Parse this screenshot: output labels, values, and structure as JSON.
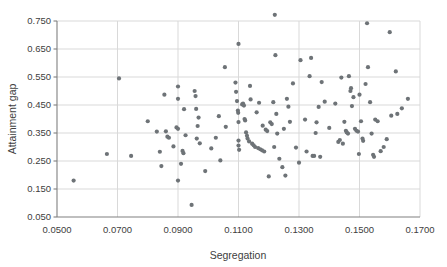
{
  "chart_data": {
    "type": "scatter",
    "title": "",
    "xlabel": "Segregation",
    "ylabel": "Attainment gap",
    "xlim": [
      0.05,
      0.17
    ],
    "ylim": [
      0.05,
      0.75
    ],
    "xticks": [
      0.05,
      0.07,
      0.09,
      0.11,
      0.13,
      0.15,
      0.17
    ],
    "yticks": [
      0.05,
      0.15,
      0.25,
      0.35,
      0.45,
      0.55,
      0.65,
      0.75
    ],
    "xtick_labels": [
      "0.0500",
      "0.0700",
      "0.0900",
      "0.1100",
      "0.1300",
      "0.1500",
      "0.1700"
    ],
    "ytick_labels": [
      "0.050",
      "0.150",
      "0.250",
      "0.350",
      "0.450",
      "0.550",
      "0.650",
      "0.750"
    ],
    "grid": "both",
    "grid_color": "#d9d9d9",
    "axis_color": "#808080",
    "marker_color": "#6e7377",
    "marker_size": 4.2,
    "legend": "none",
    "series": [
      {
        "name": "districts",
        "points": [
          [
            0.0555,
            0.18
          ],
          [
            0.0665,
            0.275
          ],
          [
            0.0705,
            0.545
          ],
          [
            0.0745,
            0.268
          ],
          [
            0.08,
            0.392
          ],
          [
            0.083,
            0.355
          ],
          [
            0.084,
            0.283
          ],
          [
            0.0845,
            0.232
          ],
          [
            0.0855,
            0.487
          ],
          [
            0.086,
            0.356
          ],
          [
            0.0865,
            0.337
          ],
          [
            0.087,
            0.333
          ],
          [
            0.0885,
            0.302
          ],
          [
            0.0895,
            0.37
          ],
          [
            0.09,
            0.516
          ],
          [
            0.09,
            0.472
          ],
          [
            0.09,
            0.365
          ],
          [
            0.09,
            0.18
          ],
          [
            0.091,
            0.24
          ],
          [
            0.0915,
            0.286
          ],
          [
            0.0918,
            0.278
          ],
          [
            0.092,
            0.435
          ],
          [
            0.0925,
            0.342
          ],
          [
            0.0945,
            0.093
          ],
          [
            0.0955,
            0.5
          ],
          [
            0.0958,
            0.482
          ],
          [
            0.096,
            0.436
          ],
          [
            0.0962,
            0.33
          ],
          [
            0.0965,
            0.375
          ],
          [
            0.0968,
            0.405
          ],
          [
            0.0972,
            0.313
          ],
          [
            0.099,
            0.214
          ],
          [
            0.101,
            0.295
          ],
          [
            0.1025,
            0.333
          ],
          [
            0.1035,
            0.41
          ],
          [
            0.104,
            0.252
          ],
          [
            0.1055,
            0.585
          ],
          [
            0.1058,
            0.372
          ],
          [
            0.109,
            0.53
          ],
          [
            0.1092,
            0.497
          ],
          [
            0.1095,
            0.464
          ],
          [
            0.1098,
            0.43
          ],
          [
            0.1099,
            0.422
          ],
          [
            0.11,
            0.668
          ],
          [
            0.11,
            0.389
          ],
          [
            0.11,
            0.323
          ],
          [
            0.11,
            0.305
          ],
          [
            0.1102,
            0.29
          ],
          [
            0.1112,
            0.452
          ],
          [
            0.1115,
            0.455
          ],
          [
            0.1118,
            0.448
          ],
          [
            0.112,
            0.4
          ],
          [
            0.1122,
            0.395
          ],
          [
            0.1125,
            0.352
          ],
          [
            0.1128,
            0.34
          ],
          [
            0.113,
            0.33
          ],
          [
            0.1135,
            0.32
          ],
          [
            0.1138,
            0.518
          ],
          [
            0.114,
            0.47
          ],
          [
            0.1145,
            0.312
          ],
          [
            0.115,
            0.306
          ],
          [
            0.1155,
            0.3
          ],
          [
            0.116,
            0.424
          ],
          [
            0.1165,
            0.296
          ],
          [
            0.1168,
            0.458
          ],
          [
            0.1172,
            0.292
          ],
          [
            0.1178,
            0.288
          ],
          [
            0.118,
            0.376
          ],
          [
            0.1185,
            0.284
          ],
          [
            0.119,
            0.362
          ],
          [
            0.1195,
            0.357
          ],
          [
            0.12,
            0.195
          ],
          [
            0.1205,
            0.388
          ],
          [
            0.121,
            0.382
          ],
          [
            0.1215,
            0.46
          ],
          [
            0.1218,
            0.3
          ],
          [
            0.122,
            0.772
          ],
          [
            0.1222,
            0.628
          ],
          [
            0.1225,
            0.418
          ],
          [
            0.1228,
            0.348
          ],
          [
            0.1235,
            0.258
          ],
          [
            0.1245,
            0.228
          ],
          [
            0.125,
            0.365
          ],
          [
            0.1255,
            0.198
          ],
          [
            0.126,
            0.472
          ],
          [
            0.1265,
            0.444
          ],
          [
            0.127,
            0.39
          ],
          [
            0.128,
            0.527
          ],
          [
            0.129,
            0.298
          ],
          [
            0.13,
            0.244
          ],
          [
            0.1305,
            0.61
          ],
          [
            0.132,
            0.398
          ],
          [
            0.1325,
            0.284
          ],
          [
            0.1335,
            0.553
          ],
          [
            0.134,
            0.618
          ],
          [
            0.1345,
            0.268
          ],
          [
            0.135,
            0.268
          ],
          [
            0.1355,
            0.35
          ],
          [
            0.1358,
            0.388
          ],
          [
            0.1365,
            0.443
          ],
          [
            0.137,
            0.265
          ],
          [
            0.1375,
            0.532
          ],
          [
            0.1385,
            0.462
          ],
          [
            0.14,
            0.368
          ],
          [
            0.142,
            0.455
          ],
          [
            0.143,
            0.318
          ],
          [
            0.1435,
            0.325
          ],
          [
            0.144,
            0.548
          ],
          [
            0.1445,
            0.312
          ],
          [
            0.145,
            0.39
          ],
          [
            0.1455,
            0.358
          ],
          [
            0.1458,
            0.352
          ],
          [
            0.1462,
            0.348
          ],
          [
            0.1465,
            0.553
          ],
          [
            0.147,
            0.5
          ],
          [
            0.1472,
            0.51
          ],
          [
            0.1475,
            0.446
          ],
          [
            0.148,
            0.478
          ],
          [
            0.1485,
            0.365
          ],
          [
            0.149,
            0.358
          ],
          [
            0.1495,
            0.355
          ],
          [
            0.1498,
            0.275
          ],
          [
            0.15,
            0.487
          ],
          [
            0.1505,
            0.392
          ],
          [
            0.151,
            0.33
          ],
          [
            0.1512,
            0.322
          ],
          [
            0.152,
            0.525
          ],
          [
            0.1525,
            0.742
          ],
          [
            0.1528,
            0.585
          ],
          [
            0.1535,
            0.46
          ],
          [
            0.154,
            0.348
          ],
          [
            0.1545,
            0.272
          ],
          [
            0.1548,
            0.265
          ],
          [
            0.1552,
            0.398
          ],
          [
            0.156,
            0.392
          ],
          [
            0.157,
            0.285
          ],
          [
            0.158,
            0.3
          ],
          [
            0.159,
            0.328
          ],
          [
            0.16,
            0.71
          ],
          [
            0.1605,
            0.412
          ],
          [
            0.162,
            0.57
          ],
          [
            0.1625,
            0.418
          ],
          [
            0.164,
            0.438
          ],
          [
            0.166,
            0.472
          ]
        ]
      }
    ]
  }
}
